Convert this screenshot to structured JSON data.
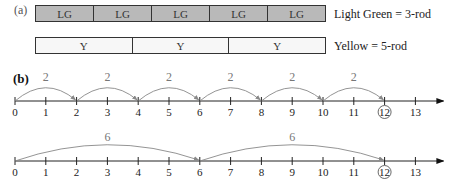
{
  "part_a": {
    "label": "(a)",
    "rods": [
      {
        "name": "light-green",
        "segments": [
          "LG",
          "LG",
          "LG",
          "LG",
          "LG"
        ],
        "legend": "Light Green = 3-rod",
        "color": "#b9b9b9"
      },
      {
        "name": "yellow",
        "segments": [
          "Y",
          "Y",
          "Y"
        ],
        "legend": "Yellow = 5-rod",
        "color": "#f7f7f7"
      }
    ]
  },
  "part_b": {
    "label": "(b)",
    "number_lines": [
      {
        "ticks": [
          "0",
          "1",
          "2",
          "3",
          "4",
          "5",
          "6",
          "7",
          "8",
          "9",
          "10",
          "11",
          "12",
          "13"
        ],
        "jump_size": "2",
        "jumps": [
          [
            0,
            2
          ],
          [
            2,
            4
          ],
          [
            4,
            6
          ],
          [
            6,
            8
          ],
          [
            8,
            10
          ],
          [
            10,
            12
          ]
        ],
        "circled": "12"
      },
      {
        "ticks": [
          "0",
          "1",
          "2",
          "3",
          "4",
          "5",
          "6",
          "7",
          "8",
          "9",
          "10",
          "11",
          "12",
          "13"
        ],
        "jump_size": "6",
        "jumps": [
          [
            0,
            6
          ],
          [
            6,
            12
          ]
        ],
        "circled": "12"
      }
    ]
  }
}
